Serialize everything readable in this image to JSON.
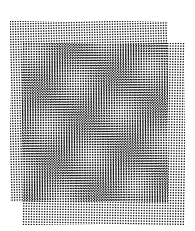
{
  "image": {
    "title": "Overlapping halftone dot grids forming a moire interference pattern",
    "width": 195,
    "height": 231,
    "background_color": "#ffffff",
    "ink_color": "#101010",
    "medium": "black-and-white halftone / screen-tone print"
  },
  "layers": [
    {
      "name": "back-grid",
      "role": "lower sheet, visible along the top and left margins",
      "shape": "square",
      "left": 10,
      "top": 21,
      "width": 158,
      "height": 181,
      "rotation_deg": -1.4,
      "dot_pitch_px": 2.55,
      "dot_radius_px": 0.72,
      "dot_color": "#101010"
    },
    {
      "name": "front-grid",
      "role": "upper sheet, offset down and to the right, visible along the bottom and right margins",
      "shape": "square",
      "left": 22,
      "top": 43,
      "width": 163,
      "height": 182,
      "rotation_deg": 0.9,
      "dot_pitch_px": 2.62,
      "dot_radius_px": 0.72,
      "dot_color": "#101010"
    }
  ],
  "overlap_region": {
    "name": "moire-overlap",
    "left": 22,
    "top": 43,
    "width": 146,
    "height": 159,
    "description": "Region where both grids superimpose, producing the interference figure"
  },
  "moire_figure": {
    "type": "beat-interference",
    "motif": "2x2 array of light circular eyes separated by dark diagonal cross bands",
    "light_eye_count": 4,
    "light_eye_centers": [
      {
        "x": 62,
        "y": 88
      },
      {
        "x": 128,
        "y": 86
      },
      {
        "x": 60,
        "y": 158
      },
      {
        "x": 126,
        "y": 156
      }
    ],
    "light_eye_radius_px": 24,
    "dark_band_orientation": "diagonal, forming an X through the centre of the overlap",
    "center_saddle": {
      "x": 95,
      "y": 122
    },
    "beat_period_px": 68,
    "contrast": "dark bands nearly solid black, eye centres near white"
  },
  "margins": {
    "top_strip": "back grid alone, plain tilted dot lattice",
    "left_strip": "back grid alone, plain tilted dot lattice",
    "bottom_strip": "front grid alone, plain dot lattice",
    "right_strip": "front grid alone, plain dot lattice"
  }
}
